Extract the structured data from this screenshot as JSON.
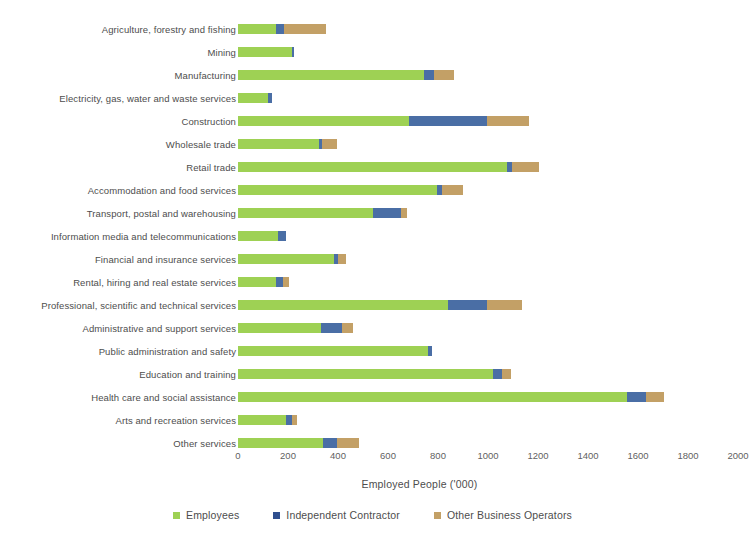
{
  "chart_data": {
    "type": "bar",
    "orientation": "horizontal",
    "stacked": true,
    "title": "",
    "xlabel": "Employed People ('000)",
    "ylabel": "",
    "xlim": [
      0,
      2000
    ],
    "xticks": [
      0,
      200,
      400,
      600,
      800,
      1000,
      1200,
      1400,
      1600,
      1800,
      2000
    ],
    "grid": false,
    "legend_position": "bottom",
    "colors": {
      "Employees": "#9ed154",
      "Independent Contractor": "#2f4f8f",
      "Other Business Operators": "#c3a066"
    },
    "categories": [
      "Agriculture, forestry and fishing",
      "Mining",
      "Manufacturing",
      "Electricity, gas, water and waste services",
      "Construction",
      "Wholesale trade",
      "Retail trade",
      "Accommodation and food services",
      "Transport, postal and warehousing",
      "Information media and telecommunications",
      "Financial and insurance services",
      "Rental, hiring and real estate services",
      "Professional, scientific and technical services",
      "Administrative and support services",
      "Public administration and safety",
      "Education and training",
      "Health care and social assistance",
      "Arts and recreation services",
      "Other services"
    ],
    "series": [
      {
        "name": "Employees",
        "values": [
          150,
          215,
          745,
          120,
          685,
          325,
          1075,
          795,
          540,
          160,
          385,
          150,
          840,
          330,
          760,
          1020,
          1555,
          190,
          340
        ]
      },
      {
        "name": "Independent Contractor",
        "values": [
          35,
          10,
          40,
          15,
          310,
          10,
          20,
          20,
          110,
          30,
          15,
          30,
          155,
          85,
          15,
          35,
          75,
          25,
          55
        ]
      },
      {
        "name": "Other Business Operators",
        "values": [
          165,
          0,
          80,
          0,
          170,
          60,
          110,
          85,
          25,
          0,
          30,
          25,
          140,
          45,
          0,
          35,
          75,
          20,
          90
        ]
      }
    ],
    "totals": [
      350,
      225,
      865,
      135,
      1165,
      395,
      1205,
      900,
      675,
      190,
      430,
      205,
      1135,
      460,
      775,
      1090,
      1705,
      235,
      485
    ]
  }
}
